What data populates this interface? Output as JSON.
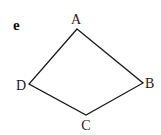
{
  "figure": {
    "part_label": "e",
    "shape": "quadrilateral",
    "stroke_color": "#1a1a1a",
    "vertices": [
      {
        "name": "A",
        "x": 77,
        "y": 29,
        "label_x": 76,
        "label_y": 24
      },
      {
        "name": "B",
        "x": 143,
        "y": 83,
        "label_x": 150,
        "label_y": 88
      },
      {
        "name": "C",
        "x": 86,
        "y": 115,
        "label_x": 86,
        "label_y": 130
      },
      {
        "name": "D",
        "x": 29,
        "y": 84,
        "label_x": 21,
        "label_y": 90
      }
    ],
    "edges": [
      "AB",
      "BC",
      "CD",
      "DA"
    ]
  }
}
